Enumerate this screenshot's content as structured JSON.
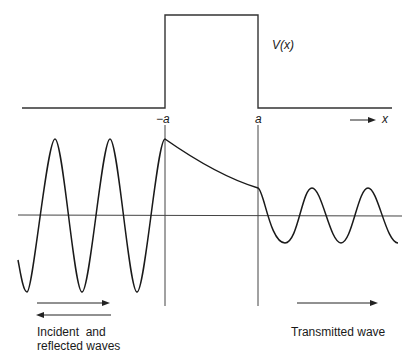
{
  "diagram": {
    "potential_label": "V(x)",
    "barrier_left_label": "−a",
    "barrier_right_label": "a",
    "x_axis_label": "x",
    "incident_label_line1": "Incident  and",
    "incident_label_line2": "reflected waves",
    "transmitted_label": "Transmitted wave",
    "colors": {
      "ink": "#1a1a1a",
      "background": "#ffffff"
    },
    "regions": [
      {
        "name": "incident",
        "description": "large-amplitude oscillation (incident + reflected)"
      },
      {
        "name": "barrier",
        "description": "exponential decay inside barrier from -a to a"
      },
      {
        "name": "transmitted",
        "description": "smaller-amplitude oscillation"
      }
    ]
  }
}
